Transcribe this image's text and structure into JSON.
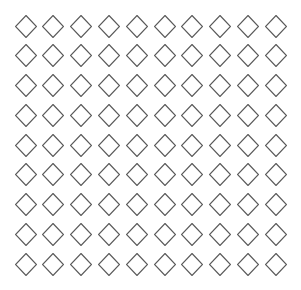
{
  "canvas": {
    "width": 301,
    "height": 290,
    "background": "#ffffff"
  },
  "grid": {
    "rows": 9,
    "columns": 10,
    "shape": "diamond-outline-icon",
    "stroke_color": "#5a5a5a",
    "stroke_width": 1.2,
    "shape_width": 21,
    "shape_height": 22,
    "column_centers": [
      25.5,
      53.3,
      81.1,
      108.9,
      136.7,
      164.5,
      192.3,
      220.1,
      247.9,
      275.7
    ],
    "row_centers": [
      26,
      55.7,
      85.5,
      115.2,
      145,
      174.7,
      204.5,
      234.2,
      264.5
    ]
  }
}
